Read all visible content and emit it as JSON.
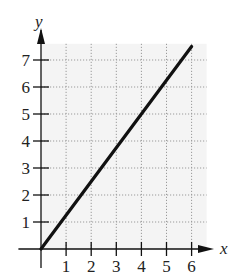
{
  "chart_data": {
    "type": "line",
    "title": "",
    "xlabel": "x",
    "ylabel": "y",
    "xlim": [
      0,
      6
    ],
    "ylim": [
      0,
      7.5
    ],
    "x_ticks": [
      1,
      2,
      3,
      4,
      5,
      6
    ],
    "y_ticks": [
      1,
      2,
      3,
      4,
      5,
      6,
      7
    ],
    "grid": true,
    "grid_style": "dotted",
    "legend": null,
    "series": [
      {
        "name": "line",
        "x": [
          0,
          6
        ],
        "y": [
          0,
          7.5
        ],
        "equation": "y = 1.25x",
        "color": "#111111"
      }
    ]
  },
  "labels": {
    "x_axis": "x",
    "y_axis": "y",
    "x_ticks": [
      "1",
      "2",
      "3",
      "4",
      "5",
      "6"
    ],
    "y_ticks": [
      "1",
      "2",
      "3",
      "4",
      "5",
      "6",
      "7"
    ]
  },
  "colors": {
    "axis": "#111111",
    "grid": "#9a9a9a",
    "plot_bg": "#f4f4f4",
    "line": "#111111"
  }
}
